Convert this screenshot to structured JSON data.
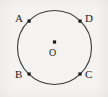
{
  "figure": {
    "type": "circle-geometry-diagram",
    "background_color": "#f4f3f1",
    "stroke_color": "#3a3a3a",
    "label_color": "#1b1b1b",
    "circle": {
      "center_x": 54.5,
      "center_y": 47.5,
      "radius": 37,
      "filled": false
    },
    "center_point": {
      "label": "O",
      "dot_x": 54.5,
      "dot_y": 42,
      "label_x": 54.5,
      "label_y": 53
    },
    "points": [
      {
        "label": "A",
        "dot_x": 29,
        "dot_y": 21,
        "label_side": "left"
      },
      {
        "label": "D",
        "dot_x": 80,
        "dot_y": 21,
        "label_side": "right"
      },
      {
        "label": "B",
        "dot_x": 29,
        "dot_y": 74,
        "label_side": "left"
      },
      {
        "label": "C",
        "dot_x": 80,
        "dot_y": 74,
        "label_side": "right"
      }
    ]
  }
}
